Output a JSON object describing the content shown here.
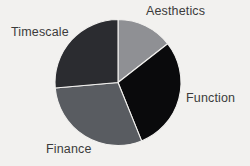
{
  "background_color": "#f2f1ef",
  "chart_data": {
    "type": "pie",
    "title": "",
    "subtitle": "",
    "xlabel": "",
    "ylabel": "",
    "grid": false,
    "legend_position": "none",
    "label_placement": "outside",
    "center": {
      "x": 118,
      "y": 82.5
    },
    "radius": 63,
    "start_angle_deg": 0,
    "direction": "clockwise",
    "categories": [
      "Aesthetics",
      "Function",
      "Finance",
      "Timescale"
    ],
    "values": [
      14,
      30,
      30,
      26
    ],
    "units": "percent",
    "colors": [
      "#8f9094",
      "#0a0a0c",
      "#595c61",
      "#2b2c30"
    ],
    "slices": [
      {
        "label": "Aesthetics",
        "value": 14,
        "color": "#8f9094",
        "start_angle_deg": 0,
        "end_angle_deg": 52,
        "label_position": "top-right"
      },
      {
        "label": "Function",
        "value": 30,
        "color": "#0a0a0c",
        "start_angle_deg": 52,
        "end_angle_deg": 158,
        "label_position": "right"
      },
      {
        "label": "Finance",
        "value": 30,
        "color": "#595c61",
        "start_angle_deg": 158,
        "end_angle_deg": 265,
        "label_position": "bottom-left"
      },
      {
        "label": "Timescale",
        "value": 26,
        "color": "#2b2c30",
        "start_angle_deg": 265,
        "end_angle_deg": 360,
        "label_position": "top-left"
      }
    ],
    "labels": {
      "aesthetics": "Aesthetics",
      "function": "Function",
      "finance": "Finance",
      "timescale": "Timescale"
    }
  }
}
